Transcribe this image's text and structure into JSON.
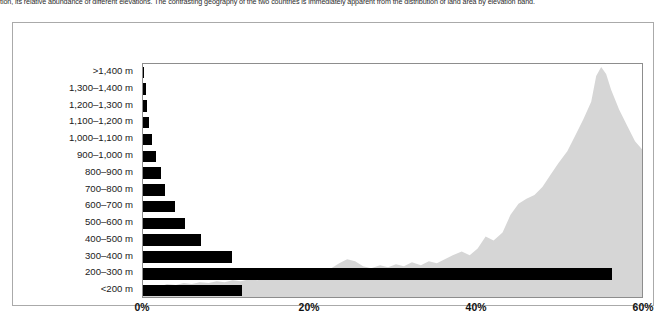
{
  "caption": {
    "text": "tion, its relative abundance of different elevations. The contrasting geography of the two countries is immediately apparent from the distribution of land area by elevation band."
  },
  "chart_data": {
    "type": "bar",
    "orientation": "horizontal",
    "title": "",
    "xlabel": "",
    "ylabel": "",
    "categories": [
      ">1,400 m",
      "1,300–1,400 m",
      "1,200–1,300 m",
      "1,100–1,200 m",
      "1,000–1,100 m",
      "900–1,000 m",
      "800–900 m",
      "700–800 m",
      "600–700 m",
      "500–600 m",
      "400–500 m",
      "300–400 m",
      "200–300 m",
      "<200 m"
    ],
    "values": [
      0.0,
      0.3,
      0.5,
      0.7,
      1.1,
      1.6,
      2.2,
      2.6,
      3.8,
      5.0,
      7.0,
      10.7,
      56.2,
      11.9
    ],
    "xlim": [
      0,
      60
    ],
    "xticks": [
      0,
      20,
      40,
      60
    ],
    "xticklabels": [
      "0%",
      "20%",
      "40%",
      "60%"
    ],
    "grid": false,
    "legend": null,
    "bar_color": "#000000",
    "backdrop": {
      "name": "mountain-silhouette",
      "color": "#d6d6d6",
      "description": "light grey mountain profile silhouette rendered behind the bars"
    }
  },
  "colors": {
    "bar": "#000000",
    "backdrop": "#d6d6d6",
    "axis": "#8d8d8d",
    "frame": "#aaaaaa",
    "text": "#1a1a1a",
    "background": "#ffffff"
  }
}
